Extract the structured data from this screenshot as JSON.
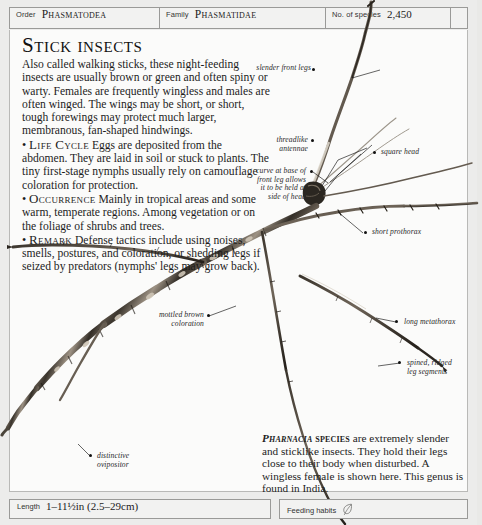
{
  "header": {
    "cells": [
      {
        "label": "Order",
        "value": "Phasmatodea"
      },
      {
        "label": "Family",
        "value": "Phasmatidae"
      },
      {
        "label": "No. of species",
        "value": "2,450"
      }
    ]
  },
  "article": {
    "title": "Stick insects",
    "intro": "Also called walking sticks, these night-feeding insects are usually brown or green and often spiny or warty. Females are frequently wingless and males are often winged. The wings may be short, or short, tough forewings may protect much larger, membranous, fan-shaped hindwings.",
    "sections": [
      {
        "bullet": "•",
        "heading": "Life Cycle",
        "text": "Eggs are deposited from the abdomen. They are laid in soil or stuck to plants. The tiny first-stage nymphs usually rely on camouflage coloration for protection."
      },
      {
        "bullet": "•",
        "heading": "Occurrence",
        "text": "Mainly in tropical areas and some warm, temperate regions. Among vegetation or on the foliage of shrubs and trees."
      },
      {
        "bullet": "•",
        "heading": "Remark",
        "text": "Defense tactics include using noises, smells, postures, and coloration, or shedding legs if seized by predators (nymphs' legs may grow back)."
      }
    ]
  },
  "caption": {
    "genus": "Pharnacia",
    "species_word": "species",
    "text": " are extremely slender and sticklike insects. They hold their legs close to their body when disturbed. A wingless female is shown here. This genus is found in India."
  },
  "annotations": [
    {
      "id": "slender-front-legs",
      "text": "slender front legs"
    },
    {
      "id": "threadlike-antennae",
      "text": "threadlike\nantennae"
    },
    {
      "id": "square-head",
      "text": "square head"
    },
    {
      "id": "curve-front-leg",
      "text": "curve at base of\nfront leg allows\nit to be held at\nside of head"
    },
    {
      "id": "short-prothorax",
      "text": "short prothorax"
    },
    {
      "id": "mottled-brown",
      "text": "mottled brown\ncoloration"
    },
    {
      "id": "long-metathorax",
      "text": "long metathorax"
    },
    {
      "id": "spined-ridged-legs",
      "text": "spined, ridged\nleg segments"
    },
    {
      "id": "distinctive-ovipositor",
      "text": "distinctive\novipositor"
    }
  ],
  "footer": {
    "length": {
      "label": "Length",
      "value": "1–11½in (2.5–29cm)"
    },
    "feeding": {
      "label": "Feeding habits",
      "icon": "leaf-icon"
    }
  },
  "colors": {
    "page_background": "#ececeb",
    "panel": "#fbfbfa",
    "rule": "#9a9a98",
    "text": "#1d1d1d",
    "insect_dark": "#2e2a25",
    "insect_mid": "#6b6055",
    "insect_light": "#b7ada0"
  }
}
